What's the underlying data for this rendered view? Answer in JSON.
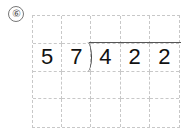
{
  "problem": {
    "number_label": "⑥",
    "divisor": "57",
    "dividend": "422"
  },
  "grid": {
    "rows": [
      [
        "",
        "",
        "",
        "",
        ""
      ],
      [
        "5",
        "7",
        "4",
        "2",
        "2"
      ],
      [
        "",
        "",
        "",
        "",
        ""
      ],
      [
        "",
        "",
        "",
        "",
        ""
      ]
    ]
  }
}
